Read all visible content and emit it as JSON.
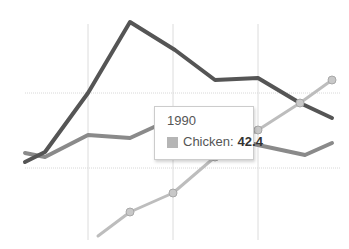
{
  "chart_data": {
    "type": "line",
    "title": "",
    "xlabel": "",
    "ylabel": "",
    "grid": true,
    "legend": "none visible",
    "x_pixel_gridlines": [
      88,
      173,
      258
    ],
    "y_pixel_gridlines": [
      93,
      168
    ],
    "series": [
      {
        "name": "Series A (dark)",
        "color": "#555555",
        "markers": false,
        "points_px": [
          [
            25,
            162
          ],
          [
            45,
            152
          ],
          [
            88,
            93
          ],
          [
            130,
            22
          ],
          [
            175,
            50
          ],
          [
            215,
            80
          ],
          [
            258,
            78
          ],
          [
            300,
            103
          ],
          [
            332,
            118
          ]
        ]
      },
      {
        "name": "Series B (medium)",
        "color": "#8a8a8a",
        "markers": false,
        "points_px": [
          [
            25,
            153
          ],
          [
            45,
            157
          ],
          [
            88,
            135
          ],
          [
            130,
            138
          ],
          [
            165,
            122
          ],
          [
            258,
            145
          ],
          [
            305,
            155
          ],
          [
            332,
            143
          ]
        ]
      },
      {
        "name": "Chicken",
        "color": "#bdbdbd",
        "markers": true,
        "points_px": [
          [
            98,
            236
          ],
          [
            130,
            212
          ],
          [
            173,
            193
          ],
          [
            215,
            157
          ],
          [
            258,
            130
          ],
          [
            300,
            103
          ],
          [
            332,
            80
          ]
        ],
        "highlighted": {
          "x_label": "1990",
          "value": 42.4
        }
      }
    ]
  },
  "tooltip": {
    "title": "1990",
    "series_label": "Chicken:",
    "value": "42.4",
    "swatch_color": "#b5b5b5"
  }
}
